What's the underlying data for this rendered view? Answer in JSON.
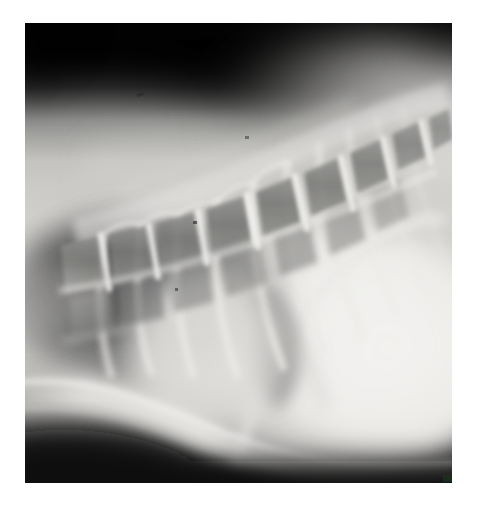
{
  "image": {
    "kind": "radiograph",
    "modality": "X-ray",
    "view": "lateral",
    "body_region": "thorax",
    "caption_text": "",
    "alt_text": "Lateral thoracic radiograph showing the vertebral column, ribs, lung fields, cardiac silhouette and diaphragm",
    "width_px": 479,
    "height_px": 505,
    "canvas_background": "#ffffff",
    "plate": {
      "left_px": 25,
      "top_px": 23,
      "width_px": 427,
      "height_px": 460
    },
    "colors": {
      "background": "#ffffff",
      "film_dark": "#0d0d0d",
      "film_mid": "#8a8a8a",
      "film_bright": "#f0efed",
      "bone_white": "#ededea",
      "lung_dark": "#4a4a4a",
      "soft_tissue": "#c9c8c5",
      "jpeg_artifact_green": "#1d3a1d"
    },
    "anatomy": [
      {
        "id": "vertebral-column",
        "label": "Vertebral column (thoracic spine)"
      },
      {
        "id": "vertebral-bodies",
        "label": "Vertebral bodies"
      },
      {
        "id": "intervertebral-discs",
        "label": "Intervertebral disc spaces"
      },
      {
        "id": "ribs",
        "label": "Ribs"
      },
      {
        "id": "lung-field",
        "label": "Lung field (radiolucent)"
      },
      {
        "id": "cardiac-silhouette",
        "label": "Cardiac silhouette"
      },
      {
        "id": "diaphragm",
        "label": "Diaphragm"
      },
      {
        "id": "sternum",
        "label": "Sternum / ventral body wall"
      },
      {
        "id": "abdomen",
        "label": "Cranial abdomen / liver"
      },
      {
        "id": "collimation-edge",
        "label": "Collimation border"
      }
    ],
    "artifacts": [
      {
        "id": "dust-speck-1",
        "label": "Film dust speck"
      },
      {
        "id": "dust-speck-2",
        "label": "Film dust speck"
      },
      {
        "id": "dust-speck-3",
        "label": "Film dust speck"
      },
      {
        "id": "dust-speck-4",
        "label": "Film dust speck"
      },
      {
        "id": "jpeg-speck",
        "label": "Green compression artifact at lower-right corner"
      }
    ]
  }
}
